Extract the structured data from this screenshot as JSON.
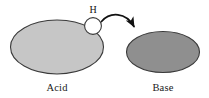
{
  "diagram": {
    "background_color": "#ffffff",
    "acid": {
      "label": "Acid",
      "fill_color": "#c6c6c6",
      "stroke_color": "#3a3a3a",
      "cx": 57,
      "cy": 47,
      "rx": 47,
      "ry": 27
    },
    "base": {
      "label": "Base",
      "fill_color": "#8f8f8f",
      "stroke_color": "#3a3a3a",
      "cx": 163,
      "cy": 52,
      "rx": 37,
      "ry": 21
    },
    "proton": {
      "label": "H",
      "fill_color": "#ffffff",
      "stroke_color": "#3a3a3a",
      "cx": 93,
      "cy": 26,
      "r": 8.5
    },
    "arrow": {
      "name": "proton-transfer-arrow",
      "color": "#111111",
      "start_x": 101,
      "start_y": 22,
      "end_x": 137,
      "end_y": 33
    }
  }
}
